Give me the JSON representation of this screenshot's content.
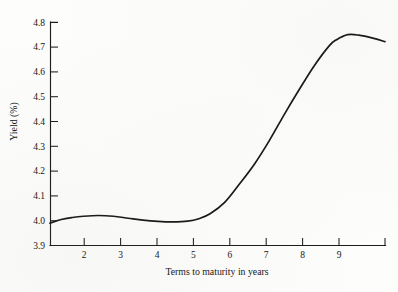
{
  "chart_data": {
    "type": "line",
    "title": "",
    "xlabel": "Terms to maturity in years",
    "ylabel": "Yield (%)",
    "xlim": [
      1.3,
      10.3
    ],
    "ylim": [
      3.9,
      4.8
    ],
    "grid": false,
    "legend": null,
    "x_ticks": [
      2,
      3,
      4,
      5,
      6,
      7,
      8,
      9
    ],
    "x_tick_labels": [
      "2",
      "3",
      "4",
      "5",
      "6",
      "7",
      "8",
      "9"
    ],
    "y_ticks": [
      3.9,
      4.0,
      4.1,
      4.2,
      4.3,
      4.4,
      4.5,
      4.6,
      4.7,
      4.8
    ],
    "y_tick_labels": [
      "3.9",
      "4.0",
      "4.1",
      "4.2",
      "4.3",
      "4.4",
      "4.5",
      "4.6",
      "4.7",
      "4.8"
    ],
    "series": [
      {
        "name": "yield curve",
        "color": "#161616",
        "x": [
          1.3,
          1.6,
          1.9,
          2.2,
          2.6,
          3.0,
          3.4,
          3.8,
          4.2,
          4.6,
          5.0,
          5.3,
          5.6,
          6.0,
          6.4,
          6.8,
          7.2,
          7.6,
          8.0,
          8.4,
          8.8,
          9.0,
          9.3,
          9.6,
          10.0,
          10.3
        ],
        "y": [
          3.99,
          4.005,
          4.013,
          4.018,
          4.021,
          4.018,
          4.01,
          4.002,
          3.997,
          3.995,
          3.998,
          4.008,
          4.028,
          4.075,
          4.15,
          4.23,
          4.325,
          4.43,
          4.53,
          4.625,
          4.705,
          4.73,
          4.75,
          4.748,
          4.735,
          4.722
        ]
      }
    ],
    "annotations": []
  },
  "figure": {
    "background_color": "#fdfdfc",
    "line_color": "#161616",
    "axis_color": "#1c1c1c"
  }
}
